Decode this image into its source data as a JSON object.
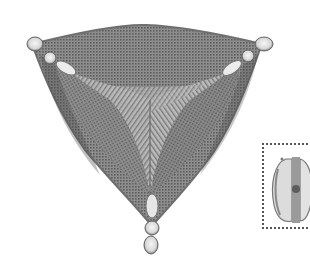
{
  "image": {
    "subject": "diatom-illustration",
    "description": "Pencil/ink scientific drawing of a triangular diatom valve with reticulate (grid-patterned) surface, three rounded poles at the corners, and a feather-like Y-shaped central structure",
    "colors": {
      "background": "#ffffff",
      "shell_fill": "#8a8a8a",
      "shell_dark": "#5a5a5a",
      "shell_outline": "#6f6f6f",
      "pole_highlight": "#e8e8e8",
      "feather_light": "#cfcfcf",
      "inset_border": "#555555"
    }
  },
  "inset": {
    "subject": "partial-side-view-sketch",
    "framed": true,
    "frame_style": "dotted"
  }
}
